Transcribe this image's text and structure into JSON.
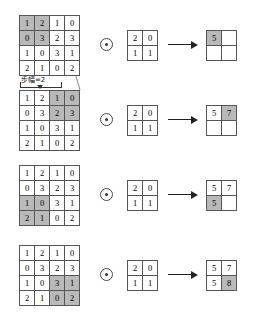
{
  "figure": {
    "operator_symbol": "circled-dot",
    "arrow_symbol": "right-arrow",
    "colors": {
      "highlight": "#b9b9b9",
      "grid_line": "#555555",
      "text": "#000000",
      "background": "#ffffff"
    }
  },
  "annotation": {
    "stride_label": "步幅=2"
  },
  "input_matrix": {
    "rows": 4,
    "cols": 4,
    "values": [
      [
        1,
        2,
        1,
        0
      ],
      [
        0,
        3,
        2,
        3
      ],
      [
        1,
        0,
        3,
        1
      ],
      [
        2,
        1,
        0,
        2
      ]
    ]
  },
  "kernel_matrix": {
    "rows": 2,
    "cols": 2,
    "values": [
      [
        2,
        0
      ],
      [
        1,
        1
      ]
    ]
  },
  "steps": [
    {
      "index": 1,
      "window_origin": [
        0,
        0
      ],
      "highlighted_input_cells": [
        [
          0,
          0
        ],
        [
          0,
          1
        ],
        [
          1,
          0
        ],
        [
          1,
          1
        ]
      ],
      "output_values": [
        [
          "5",
          ""
        ],
        [
          "",
          ""
        ]
      ],
      "highlighted_output_cells": [
        [
          0,
          0
        ]
      ],
      "computed_value": 5
    },
    {
      "index": 2,
      "window_origin": [
        0,
        2
      ],
      "highlighted_input_cells": [
        [
          0,
          2
        ],
        [
          0,
          3
        ],
        [
          1,
          2
        ],
        [
          1,
          3
        ]
      ],
      "output_values": [
        [
          "5",
          "7"
        ],
        [
          "",
          ""
        ]
      ],
      "highlighted_output_cells": [
        [
          0,
          1
        ]
      ],
      "computed_value": 7
    },
    {
      "index": 3,
      "window_origin": [
        2,
        0
      ],
      "highlighted_input_cells": [
        [
          2,
          0
        ],
        [
          2,
          1
        ],
        [
          3,
          0
        ],
        [
          3,
          1
        ]
      ],
      "output_values": [
        [
          "5",
          "7"
        ],
        [
          "5",
          ""
        ]
      ],
      "highlighted_output_cells": [
        [
          1,
          0
        ]
      ],
      "computed_value": 5
    },
    {
      "index": 4,
      "window_origin": [
        2,
        2
      ],
      "highlighted_input_cells": [
        [
          2,
          2
        ],
        [
          2,
          3
        ],
        [
          3,
          2
        ],
        [
          3,
          3
        ]
      ],
      "output_values": [
        [
          "5",
          "7"
        ],
        [
          "5",
          "8"
        ]
      ],
      "highlighted_output_cells": [
        [
          1,
          1
        ]
      ],
      "computed_value": 8
    }
  ]
}
